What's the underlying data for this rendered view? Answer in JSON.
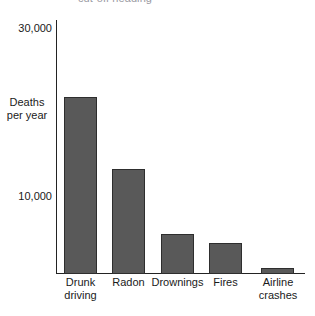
{
  "chart_data": {
    "type": "bar",
    "title": "",
    "xlabel": "",
    "ylabel": "Deaths per year",
    "ylabel_line1": "Deaths",
    "ylabel_line2": "per year",
    "categories": [
      "Drunk driving",
      "Radon",
      "Drownings",
      "Fires",
      "Airline crashes"
    ],
    "category_lines": [
      [
        "Drunk",
        "driving"
      ],
      [
        "Radon",
        ""
      ],
      [
        "Drownings",
        ""
      ],
      [
        "Fires",
        ""
      ],
      [
        "Airline",
        "crashes"
      ]
    ],
    "values": [
      22000,
      13000,
      5000,
      3800,
      750
    ],
    "ylim": [
      0,
      31500
    ],
    "ytick_values": [
      10000,
      30000
    ],
    "ytick_labels": [
      "10,000",
      "30,000"
    ],
    "grid": false,
    "legend": false,
    "bar_color": "#595959",
    "bar_border_color": "#2e2e2e",
    "axis_color": "#232323",
    "background_color": "#ffffff"
  },
  "partial_title": {
    "text": "cut-off heading"
  }
}
